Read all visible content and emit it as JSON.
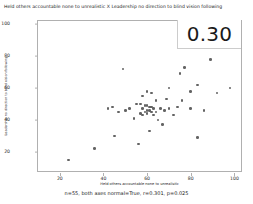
{
  "chart_data": {
    "type": "scatter",
    "title": "Held others accountable none to unrealistic X Leadership no direction to blind vision following",
    "xlabel": "Held others accountable none to unrealistic",
    "ylabel": "Leadership no direction to blind vision following",
    "xlim": [
      10,
      103
    ],
    "ylim": [
      8,
      102
    ],
    "xticks": [
      20,
      40,
      60,
      80,
      100
    ],
    "yticks": [
      20,
      40,
      60,
      80,
      100
    ],
    "grid": false,
    "legend": null,
    "marker_color": "#4d4d4d",
    "annotation": "0.30",
    "caption": "n=55, both axes normal=True, r=0.301, p=0.025",
    "stats": {
      "n": 55,
      "both_axes_normal": "True",
      "r": 0.301,
      "p": 0.025
    },
    "points": [
      {
        "x": 49,
        "y": 72
      },
      {
        "x": 75,
        "y": 69
      },
      {
        "x": 77,
        "y": 73
      },
      {
        "x": 97,
        "y": 93
      },
      {
        "x": 89,
        "y": 78
      },
      {
        "x": 83,
        "y": 62
      },
      {
        "x": 98,
        "y": 60
      },
      {
        "x": 100,
        "y": 92
      },
      {
        "x": 70,
        "y": 60
      },
      {
        "x": 60,
        "y": 58
      },
      {
        "x": 62,
        "y": 57
      },
      {
        "x": 58,
        "y": 55
      },
      {
        "x": 64,
        "y": 52
      },
      {
        "x": 55,
        "y": 50
      },
      {
        "x": 57,
        "y": 50
      },
      {
        "x": 59,
        "y": 49
      },
      {
        "x": 60,
        "y": 49
      },
      {
        "x": 61,
        "y": 48
      },
      {
        "x": 62,
        "y": 48
      },
      {
        "x": 63,
        "y": 47
      },
      {
        "x": 58,
        "y": 47
      },
      {
        "x": 60,
        "y": 46
      },
      {
        "x": 61,
        "y": 46
      },
      {
        "x": 59,
        "y": 45
      },
      {
        "x": 62,
        "y": 45
      },
      {
        "x": 64,
        "y": 45
      },
      {
        "x": 57,
        "y": 44
      },
      {
        "x": 60,
        "y": 44
      },
      {
        "x": 63,
        "y": 43
      },
      {
        "x": 58,
        "y": 43
      },
      {
        "x": 66,
        "y": 47
      },
      {
        "x": 68,
        "y": 46
      },
      {
        "x": 70,
        "y": 47
      },
      {
        "x": 52,
        "y": 47
      },
      {
        "x": 50,
        "y": 46
      },
      {
        "x": 47,
        "y": 45
      },
      {
        "x": 44,
        "y": 48
      },
      {
        "x": 42,
        "y": 47
      },
      {
        "x": 74,
        "y": 48
      },
      {
        "x": 80,
        "y": 47
      },
      {
        "x": 86,
        "y": 46
      },
      {
        "x": 76,
        "y": 52
      },
      {
        "x": 69,
        "y": 53
      },
      {
        "x": 72,
        "y": 43
      },
      {
        "x": 65,
        "y": 40
      },
      {
        "x": 67,
        "y": 37
      },
      {
        "x": 54,
        "y": 41
      },
      {
        "x": 61,
        "y": 33
      },
      {
        "x": 80,
        "y": 58
      },
      {
        "x": 92,
        "y": 57
      },
      {
        "x": 83,
        "y": 29
      },
      {
        "x": 56,
        "y": 25
      },
      {
        "x": 36,
        "y": 22
      },
      {
        "x": 45,
        "y": 30
      },
      {
        "x": 24,
        "y": 15
      }
    ]
  }
}
